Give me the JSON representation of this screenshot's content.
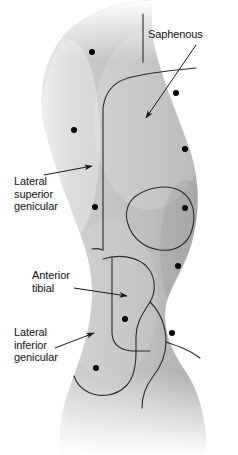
{
  "figure": {
    "width": 238,
    "height": 455,
    "background_color": "#ffffff",
    "line_color": "#2b2b2b",
    "dot_color": "#000000",
    "skin_light": "#e9e9e9",
    "skin_mid": "#c9c9c9",
    "skin_dark": "#a8a8a8"
  },
  "annotations": [
    {
      "id": "saphenous",
      "label": "Saphenous",
      "text_x": 148,
      "text_y": 28,
      "leader": {
        "x1": 196,
        "y1": 45,
        "x2": 146,
        "y2": 118
      },
      "arrow_at": "end"
    },
    {
      "id": "lateral-superior-genicular",
      "label": "Lateral\nsuperior\ngenicular",
      "text_x": 14,
      "text_y": 175,
      "leader": {
        "x1": 44,
        "y1": 175,
        "x2": 92,
        "y2": 166
      },
      "arrow_at": "end"
    },
    {
      "id": "anterior-tibial",
      "label": "Anterior\ntibial",
      "text_x": 32,
      "text_y": 269,
      "leader": {
        "x1": 74,
        "y1": 288,
        "x2": 127,
        "y2": 296
      },
      "arrow_at": "end"
    },
    {
      "id": "lateral-inferior-genicular",
      "label": "Lateral\ninferior\ngenicular",
      "text_x": 14,
      "text_y": 326,
      "leader": {
        "x1": 55,
        "y1": 348,
        "x2": 94,
        "y2": 333
      },
      "arrow_at": "end"
    }
  ],
  "marker_dots": [
    {
      "id": "dot-1",
      "x": 92,
      "y": 52,
      "r": 3.0
    },
    {
      "id": "dot-2",
      "x": 176,
      "y": 93,
      "r": 3.0
    },
    {
      "id": "dot-3",
      "x": 74,
      "y": 130,
      "r": 3.0
    },
    {
      "id": "dot-4",
      "x": 185,
      "y": 149,
      "r": 3.0
    },
    {
      "id": "dot-5",
      "x": 95,
      "y": 207,
      "r": 3.0
    },
    {
      "id": "dot-6",
      "x": 185,
      "y": 208,
      "r": 3.0
    },
    {
      "id": "dot-7",
      "x": 178,
      "y": 266,
      "r": 3.0
    },
    {
      "id": "dot-8",
      "x": 125,
      "y": 319,
      "r": 3.0
    },
    {
      "id": "dot-9",
      "x": 172,
      "y": 333,
      "r": 3.0
    },
    {
      "id": "dot-10",
      "x": 96,
      "y": 368,
      "r": 3.0
    }
  ]
}
